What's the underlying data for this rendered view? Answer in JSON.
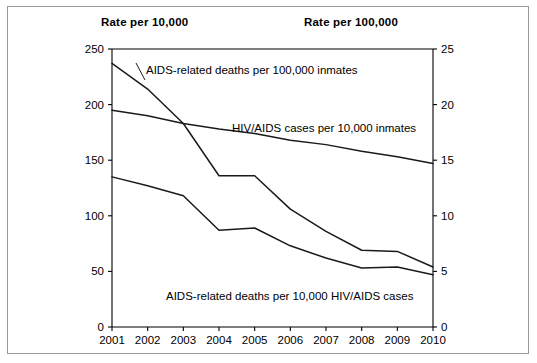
{
  "axis_captions": {
    "left": "Rate per 10,000",
    "right": "Rate per 100,000"
  },
  "chart_data": {
    "type": "line",
    "title": "",
    "xlabel": "",
    "ylabel": "Rate per 10,000",
    "y2label": "Rate per 100,000",
    "grid": false,
    "legend": "inline annotations",
    "x": [
      2001,
      2002,
      2003,
      2004,
      2005,
      2006,
      2007,
      2008,
      2009,
      2010
    ],
    "xtick_labels": [
      "2001",
      "2002",
      "2003",
      "2004",
      "2005",
      "2006",
      "2007",
      "2008",
      "2009",
      "2010"
    ],
    "ylim": [
      0,
      250
    ],
    "ytick_labels": [
      "0",
      "50",
      "100",
      "150",
      "200",
      "250"
    ],
    "ytick_values": [
      0,
      50,
      100,
      150,
      200,
      250
    ],
    "y2lim": [
      0,
      25
    ],
    "y2tick_labels": [
      "0",
      "5",
      "10",
      "15",
      "20",
      "25"
    ],
    "y2tick_values": [
      0,
      5,
      10,
      15,
      20,
      25
    ],
    "series": [
      {
        "name": "AIDS-related deaths per 100,000 inmates",
        "axis": "right",
        "label": "AIDS-related deaths per 100,000 inmates",
        "values": [
          23.7,
          21.4,
          18.3,
          13.6,
          13.6,
          10.6,
          8.6,
          6.9,
          6.8,
          5.4
        ]
      },
      {
        "name": "HIV/AIDS cases per 10,000 inmates",
        "axis": "left",
        "label": "HIV/AIDS cases per 10,000 inmates",
        "values": [
          195,
          190,
          183,
          178,
          174,
          168,
          164,
          158,
          153,
          147
        ]
      },
      {
        "name": "AIDS-related deaths per 10,000 HIV/AIDS cases",
        "axis": "left",
        "label": "AIDS-related deaths per 10,000 HIV/AIDS cases",
        "values": [
          135,
          127,
          118,
          87,
          89,
          73,
          62,
          53,
          54,
          47
        ]
      }
    ]
  }
}
